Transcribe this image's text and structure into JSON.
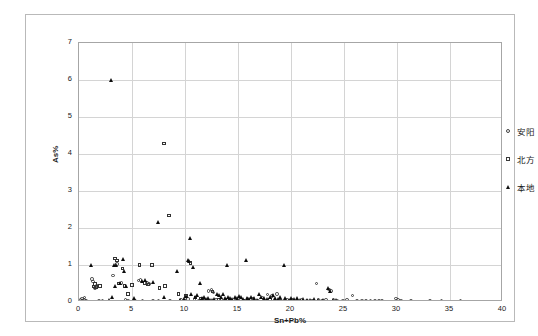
{
  "chart_data": {
    "type": "scatter",
    "title": "",
    "xlabel": "Sn+Pb%",
    "ylabel": "As%",
    "xlim": [
      0,
      40
    ],
    "ylim": [
      0,
      7
    ],
    "xticks": [
      0,
      5,
      10,
      15,
      20,
      25,
      30,
      35,
      40
    ],
    "yticks": [
      0,
      1,
      2,
      3,
      4,
      5,
      6,
      7
    ],
    "grid": true,
    "legend_position": "right",
    "series": [
      {
        "name": "安阳",
        "marker": "circle",
        "color": "#3d3d3d",
        "points": [
          [
            0.15,
            0.05
          ],
          [
            0.25,
            0.03
          ],
          [
            0.3,
            0.1
          ],
          [
            0.35,
            0.02
          ],
          [
            0.45,
            0.06
          ],
          [
            0.5,
            0.12
          ],
          [
            0.6,
            0.04
          ],
          [
            0.7,
            0.02
          ],
          [
            1.2,
            0.62
          ],
          [
            1.3,
            0.55
          ],
          [
            1.5,
            0.38
          ],
          [
            1.7,
            0.45
          ],
          [
            1.9,
            0.02
          ],
          [
            2.2,
            0.03
          ],
          [
            3.2,
            0.72
          ],
          [
            3.6,
            1.02
          ],
          [
            4.0,
            0.52
          ],
          [
            4.4,
            0.05
          ],
          [
            4.6,
            0.04
          ],
          [
            5.3,
            0.02
          ],
          [
            5.6,
            0.58
          ],
          [
            5.8,
            0.6
          ],
          [
            6.0,
            0.02
          ],
          [
            6.4,
            0.52
          ],
          [
            6.6,
            0.48
          ],
          [
            7.0,
            0.02
          ],
          [
            7.5,
            0.03
          ],
          [
            8.6,
            0.03
          ],
          [
            9.6,
            0.05
          ],
          [
            10.0,
            0.1
          ],
          [
            10.3,
            0.08
          ],
          [
            10.9,
            0.06
          ],
          [
            11.3,
            0.04
          ],
          [
            11.8,
            0.04
          ],
          [
            12.2,
            0.3
          ],
          [
            12.5,
            0.32
          ],
          [
            12.7,
            0.26
          ],
          [
            12.9,
            0.06
          ],
          [
            13.4,
            0.05
          ],
          [
            13.9,
            0.04
          ],
          [
            14.3,
            0.05
          ],
          [
            14.8,
            0.07
          ],
          [
            15.3,
            0.06
          ],
          [
            15.9,
            0.1
          ],
          [
            16.4,
            0.08
          ],
          [
            16.9,
            0.03
          ],
          [
            17.3,
            0.12
          ],
          [
            17.8,
            0.2
          ],
          [
            18.2,
            0.16
          ],
          [
            18.7,
            0.22
          ],
          [
            19.1,
            0.04
          ],
          [
            19.6,
            0.05
          ],
          [
            20.1,
            0.06
          ],
          [
            20.6,
            0.03
          ],
          [
            21.0,
            0.05
          ],
          [
            21.5,
            0.04
          ],
          [
            22.0,
            0.03
          ],
          [
            22.4,
            0.5
          ],
          [
            22.6,
            0.05
          ],
          [
            22.9,
            0.04
          ],
          [
            23.3,
            0.06
          ],
          [
            23.6,
            0.34
          ],
          [
            23.8,
            0.3
          ],
          [
            24.0,
            0.05
          ],
          [
            24.4,
            0.03
          ],
          [
            24.9,
            0.04
          ],
          [
            25.3,
            0.05
          ],
          [
            25.8,
            0.18
          ],
          [
            26.2,
            0.03
          ],
          [
            26.7,
            0.04
          ],
          [
            27.1,
            0.02
          ],
          [
            27.5,
            0.03
          ],
          [
            27.9,
            0.02
          ],
          [
            28.3,
            0.03
          ],
          [
            28.6,
            0.02
          ],
          [
            29.9,
            0.1
          ],
          [
            30.1,
            0.06
          ],
          [
            30.4,
            0.04
          ],
          [
            31.3,
            0.03
          ],
          [
            33.1,
            0.02
          ],
          [
            34.2,
            0.03
          ],
          [
            36.0,
            0.02
          ]
        ]
      },
      {
        "name": "北方",
        "marker": "square",
        "color": "#333333",
        "points": [
          [
            1.4,
            0.42
          ],
          [
            1.5,
            0.48
          ],
          [
            1.6,
            0.4
          ],
          [
            2.0,
            0.44
          ],
          [
            3.4,
            1.18
          ],
          [
            3.6,
            1.12
          ],
          [
            3.8,
            0.5
          ],
          [
            4.1,
            0.9
          ],
          [
            4.3,
            0.44
          ],
          [
            4.6,
            0.22
          ],
          [
            5.0,
            0.46
          ],
          [
            5.7,
            1.0
          ],
          [
            6.2,
            0.52
          ],
          [
            6.5,
            0.47
          ],
          [
            6.9,
            1.0
          ],
          [
            7.6,
            0.38
          ],
          [
            8.0,
            4.28
          ],
          [
            8.1,
            0.44
          ],
          [
            8.5,
            2.34
          ],
          [
            9.4,
            0.22
          ],
          [
            10.1,
            0.16
          ],
          [
            10.5,
            1.06
          ],
          [
            11.0,
            0.12
          ],
          [
            11.5,
            0.1
          ],
          [
            12.6,
            0.28
          ],
          [
            13.2,
            0.06
          ],
          [
            14.0,
            0.05
          ],
          [
            15.5,
            0.04
          ],
          [
            18.0,
            0.06
          ],
          [
            19.0,
            0.04
          ]
        ]
      },
      {
        "name": "本地",
        "marker": "triangle",
        "color": "#0d0d0d",
        "points": [
          [
            1.2,
            1.0
          ],
          [
            3.0,
            6.0
          ],
          [
            2.9,
            0.06
          ],
          [
            3.1,
            0.12
          ],
          [
            3.3,
            1.0
          ],
          [
            3.4,
            0.42
          ],
          [
            3.5,
            1.0
          ],
          [
            3.9,
            0.5
          ],
          [
            4.2,
            1.16
          ],
          [
            4.3,
            0.84
          ],
          [
            4.5,
            0.42
          ],
          [
            5.2,
            0.1
          ],
          [
            6.0,
            0.56
          ],
          [
            6.3,
            0.58
          ],
          [
            7.0,
            0.54
          ],
          [
            7.5,
            2.16
          ],
          [
            8.0,
            0.12
          ],
          [
            9.3,
            0.84
          ],
          [
            9.6,
            0.04
          ],
          [
            9.9,
            0.08
          ],
          [
            10.1,
            0.16
          ],
          [
            10.3,
            1.14
          ],
          [
            10.4,
            1.1
          ],
          [
            10.5,
            1.72
          ],
          [
            10.6,
            0.2
          ],
          [
            10.8,
            0.95
          ],
          [
            11.0,
            0.14
          ],
          [
            11.2,
            0.18
          ],
          [
            11.4,
            0.5
          ],
          [
            11.6,
            0.1
          ],
          [
            11.8,
            0.12
          ],
          [
            12.0,
            0.08
          ],
          [
            12.2,
            0.1
          ],
          [
            12.4,
            0.06
          ],
          [
            12.6,
            0.05
          ],
          [
            12.8,
            0.07
          ],
          [
            13.0,
            0.22
          ],
          [
            13.2,
            0.18
          ],
          [
            13.4,
            0.12
          ],
          [
            13.6,
            0.2
          ],
          [
            13.8,
            0.1
          ],
          [
            14.0,
            1.0
          ],
          [
            14.1,
            0.14
          ],
          [
            14.3,
            0.1
          ],
          [
            14.5,
            0.08
          ],
          [
            14.7,
            0.12
          ],
          [
            14.9,
            0.1
          ],
          [
            15.1,
            0.15
          ],
          [
            15.3,
            0.12
          ],
          [
            15.5,
            0.08
          ],
          [
            15.8,
            1.14
          ],
          [
            15.9,
            0.1
          ],
          [
            16.1,
            0.08
          ],
          [
            16.3,
            0.12
          ],
          [
            16.5,
            0.1
          ],
          [
            16.8,
            0.06
          ],
          [
            17.0,
            0.2
          ],
          [
            17.2,
            0.14
          ],
          [
            17.5,
            0.1
          ],
          [
            17.8,
            0.08
          ],
          [
            18.0,
            0.12
          ],
          [
            18.3,
            0.18
          ],
          [
            18.5,
            0.1
          ],
          [
            18.8,
            0.08
          ],
          [
            19.0,
            0.12
          ],
          [
            19.4,
            1.0
          ],
          [
            19.5,
            0.1
          ],
          [
            19.8,
            0.06
          ],
          [
            20.0,
            0.1
          ],
          [
            20.3,
            0.08
          ],
          [
            20.6,
            0.1
          ],
          [
            20.9,
            0.06
          ],
          [
            21.2,
            0.08
          ],
          [
            21.5,
            0.05
          ],
          [
            21.8,
            0.06
          ],
          [
            22.2,
            0.08
          ],
          [
            22.6,
            0.06
          ],
          [
            23.0,
            0.05
          ],
          [
            23.5,
            0.38
          ],
          [
            23.7,
            0.3
          ],
          [
            24.0,
            0.05
          ],
          [
            24.3,
            0.04
          ]
        ]
      }
    ]
  },
  "axes": {
    "y_title": "As%",
    "x_title": "Sn+Pb%",
    "y_tick_labels": [
      "0",
      "1",
      "2",
      "3",
      "4",
      "5",
      "6",
      "7"
    ],
    "x_tick_labels": [
      "0",
      "5",
      "10",
      "15",
      "20",
      "25",
      "30",
      "35",
      "40"
    ]
  },
  "legend": {
    "items": [
      {
        "label": "安阳",
        "marker": "circle-marker"
      },
      {
        "label": "北方",
        "marker": "square-marker"
      },
      {
        "label": "本地",
        "marker": "triangle-marker"
      }
    ]
  }
}
